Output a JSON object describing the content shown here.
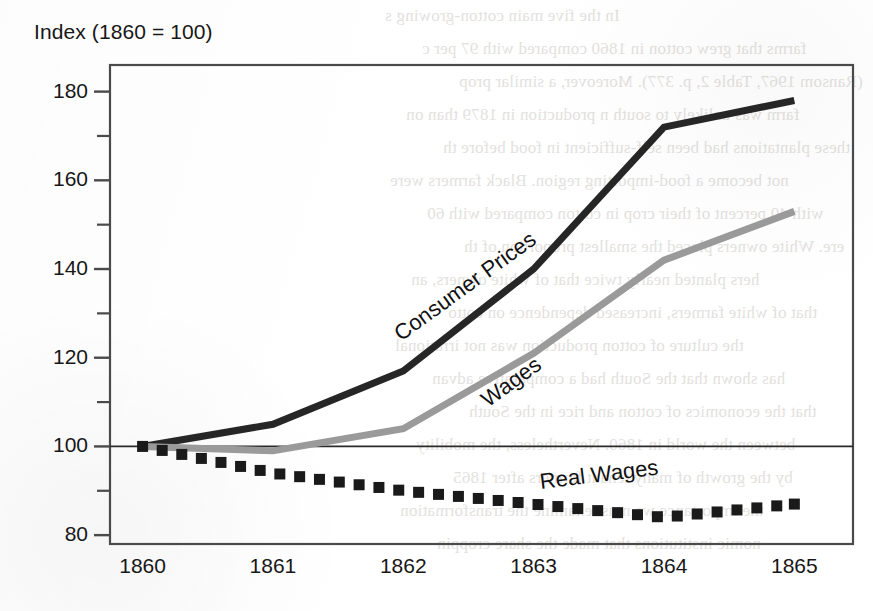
{
  "page": {
    "kind": "scanned-book-page-figure",
    "bleed_text": [
      "In the five main cotton-growing s",
      "farms that grew cotton in 1860 compared with 97 per c",
      "(Ransom 1967, Table 2, p. 377). Moreover, a similar prop",
      "farm was unlikely to south n production  in 1879 than on",
      "these plantations had been self-sufficient in food before th",
      "not become a food-importing region. Black farmers were",
      "with 40 percent of their crop in cotton compared with 60",
      "ere. White owners placed the smallest proportion of th",
      "hers planted nearly twice that of white owners, an",
      "that of white farmers, increased dependence on cotto",
      "the culture of cotton production was not irrational",
      "has shown that the South had a comparative advan",
      "that the economics of cotton and rice in the South",
      "between the world in 1860. Nevertheless, the mobility",
      "by the growth of many tenant farmers after 1865",
      "the importance we must examine the transformation",
      "nomic institutions that made the share croppin"
    ]
  },
  "chart_data": {
    "type": "line",
    "title": "Index (1860 = 100)",
    "xlabel": "",
    "ylabel": "",
    "x": [
      1860,
      1861,
      1862,
      1863,
      1864,
      1865
    ],
    "categories": [
      "1860",
      "1861",
      "1862",
      "1863",
      "1864",
      "1865"
    ],
    "xlim": [
      1859.75,
      1865.45
    ],
    "ylim": [
      78,
      186
    ],
    "yticks_major": [
      80,
      100,
      120,
      140,
      160,
      180
    ],
    "yticks_minor": [
      90,
      110,
      130,
      150,
      170
    ],
    "ytick_labels": [
      "80",
      "100",
      "120",
      "140",
      "160",
      "180"
    ],
    "xtick_labels": [
      "1860",
      "1861",
      "1862",
      "1863",
      "1864",
      "1865"
    ],
    "grid": false,
    "reference_line": 100,
    "legend": "inline-labels",
    "series": [
      {
        "name": "Consumer Prices",
        "values": [
          100,
          105,
          117,
          140,
          172,
          178
        ],
        "color": "#262626",
        "style": "solid",
        "width": 7,
        "label_x": 1861.95,
        "label_y": 125,
        "label_angle": -36
      },
      {
        "name": "Wages",
        "values": [
          100,
          99,
          104,
          121,
          142,
          153
        ],
        "color": "#9a9a9a",
        "style": "solid",
        "width": 7,
        "label_x": 1862.62,
        "label_y": 110,
        "label_angle": -36
      },
      {
        "name": "Real Wages",
        "values": [
          100,
          94,
          90,
          87,
          84,
          87
        ],
        "color": "#1a1a1a",
        "style": "dotted-squares",
        "width": 7,
        "label_x": 1863.05,
        "label_y": 92,
        "label_angle": -7
      }
    ]
  },
  "colors": {
    "consumer_prices": "#262626",
    "wages": "#9a9a9a",
    "real_wages": "#1a1a1a",
    "axis": "#4a4a4a",
    "text": "#171717",
    "background": "#ffffff"
  }
}
